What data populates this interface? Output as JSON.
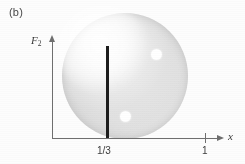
{
  "figure": {
    "panel_label": "(b)",
    "background_color": "#fdfdfd"
  },
  "axes": {
    "y_label": "F",
    "y_label_subscript": "2",
    "x_label": "x",
    "axis_color": "#6f6f6f",
    "x_ticks": [
      {
        "label": "1/3",
        "has_tick_mark": false
      },
      {
        "label": "1",
        "has_tick_mark": true
      }
    ]
  },
  "marks": {
    "vertical_bar": {
      "name": "boundary-bar-at-one-third",
      "color": "#1d1d1d"
    },
    "disc": {
      "name": "shaded-region",
      "fill_light": "#e6e6e6",
      "fill_dark": "#cacaca"
    },
    "spots": [
      {
        "name": "upper-white-spot",
        "color": "#ffffff"
      },
      {
        "name": "lower-white-spot",
        "color": "#ffffff"
      }
    ]
  },
  "chart_data": {
    "type": "scatter",
    "title": "(b)",
    "xlabel": "x",
    "ylabel": "F2",
    "xlim": [
      0,
      1.22
    ],
    "ylim": [
      0,
      1.05
    ],
    "grid": false,
    "legend": null,
    "xticks": [
      0.3333,
      1
    ],
    "xticklabels": [
      "1/3",
      "1"
    ],
    "yticks": [],
    "yticklabels": [],
    "annotations": [
      {
        "kind": "vertical-line",
        "label": "1/3",
        "x": 0.3333,
        "y_start": 0.0,
        "y_end": 0.94,
        "color": "#1d1d1d",
        "linewidth_px": 3
      },
      {
        "kind": "shaded-disc",
        "center_x": 0.7549,
        "center_y": 0.6327,
        "radius_x": 0.3824,
        "radius_y": 0.6429,
        "fill": "gray-radial-gradient",
        "fill_light": "#e6e6e6",
        "fill_dark": "#cacaca"
      }
    ],
    "series": [
      {
        "name": "white-spots",
        "marker": "circle",
        "facecolor": "#ffffff",
        "size_px": 11,
        "x": [
          0.6515,
          0.4636
        ],
        "y": [
          0.8469,
          0.2143
        ]
      }
    ]
  }
}
